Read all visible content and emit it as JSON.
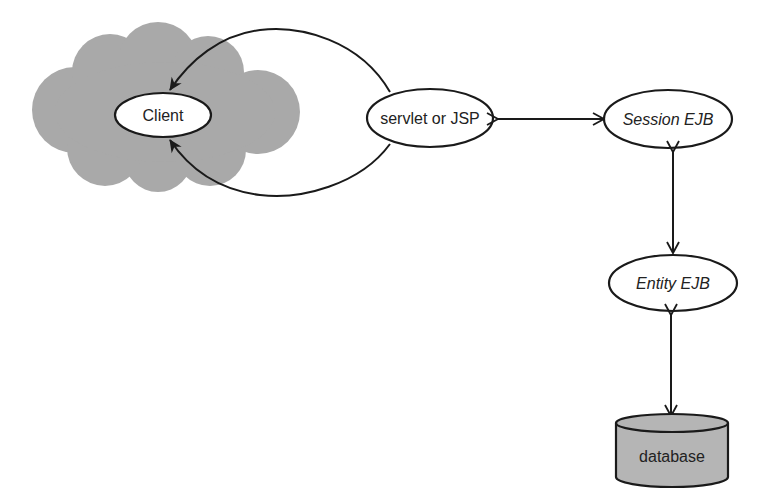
{
  "diagram": {
    "nodes": {
      "client": {
        "label": "Client",
        "shape": "ellipse",
        "container": "internet-cloud"
      },
      "servlet": {
        "label": "servlet or JSP",
        "shape": "ellipse"
      },
      "session_ejb": {
        "label": "Session EJB",
        "shape": "ellipse",
        "italic": true
      },
      "entity_ejb": {
        "label": "Entity EJB",
        "shape": "ellipse",
        "italic": true
      },
      "database": {
        "label": "database",
        "shape": "cylinder"
      }
    },
    "edges": [
      {
        "from": "servlet",
        "to": "client",
        "direction": "one-way",
        "path": "upper-arc"
      },
      {
        "from": "servlet",
        "to": "client",
        "direction": "one-way",
        "path": "lower-arc"
      },
      {
        "from": "servlet",
        "to": "session_ejb",
        "direction": "bidirectional"
      },
      {
        "from": "session_ejb",
        "to": "entity_ejb",
        "direction": "bidirectional"
      },
      {
        "from": "entity_ejb",
        "to": "database",
        "direction": "bidirectional"
      }
    ],
    "colors": {
      "cloud": "#a9a9a9",
      "database": "#b5b5b5",
      "stroke": "#1a1a1a",
      "node_fill": "#ffffff"
    }
  }
}
